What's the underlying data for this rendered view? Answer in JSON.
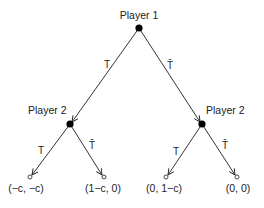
{
  "diagram": {
    "type": "game-tree",
    "root": {
      "label": "Player 1"
    },
    "player2_left": {
      "label": "Player 2"
    },
    "player2_right": {
      "label": "Player 2"
    },
    "edges": {
      "root_left": "T",
      "root_right": "T̄",
      "left_left": "T",
      "left_right": "T̄",
      "right_left": "T",
      "right_right": "T̄"
    },
    "payoffs": [
      "(−c, −c)",
      "(1−c, 0)",
      "(0, 1−c)",
      "(0, 0)"
    ]
  }
}
